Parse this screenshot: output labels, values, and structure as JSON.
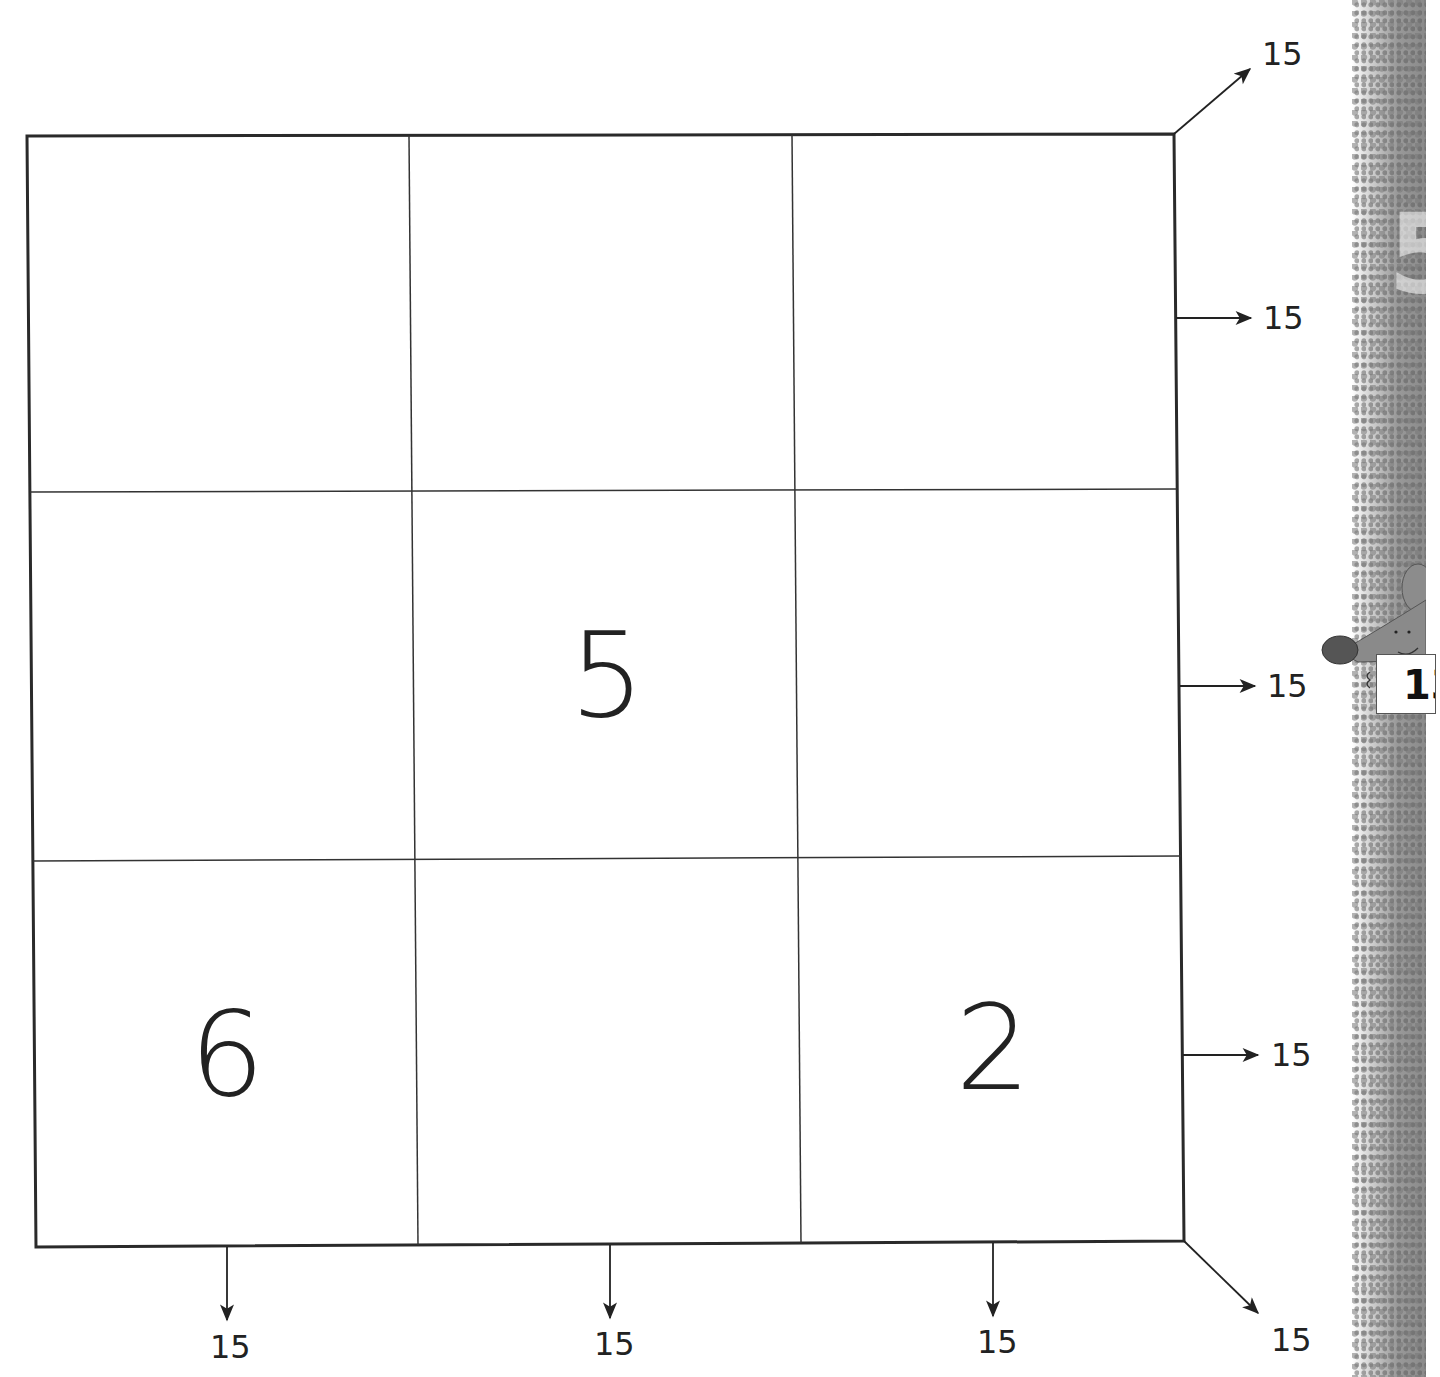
{
  "worksheet": {
    "title": "Magic Square",
    "target_sum": "15",
    "grid": {
      "rows": [
        [
          "",
          "",
          ""
        ],
        [
          "",
          "5",
          ""
        ],
        [
          "6",
          "",
          "2"
        ]
      ]
    },
    "row_sums": [
      "15",
      "15",
      "15"
    ],
    "column_sums": [
      "15",
      "15",
      "15"
    ],
    "diagonal_sums": {
      "up_right": "15",
      "down_right": "15"
    },
    "mascot": {
      "sign_text": "13",
      "description": "gray mouse holding sign"
    },
    "side_strip_digit": "5",
    "colors": {
      "line": "#2a2a2a",
      "text": "#222222",
      "strip": "#9a9a9a"
    }
  }
}
